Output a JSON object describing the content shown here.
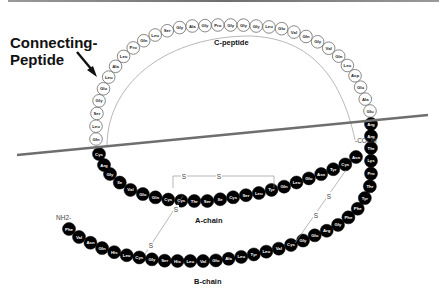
{
  "title": {
    "line1": "Connecting-",
    "line2": "Peptide"
  },
  "labels": {
    "c_peptide": "C-peptide",
    "a_chain": "A-chain",
    "b_chain": "B-chain",
    "nh2": "NH2-",
    "cooh": "-COOH",
    "sulfur": "S"
  },
  "colors": {
    "cleavage_line": "#6e6e6e",
    "chain_fill": "#000000",
    "c_peptide_fill": "#ffffff"
  },
  "c_peptide_residues": [
    "Gln",
    "Leu",
    "Ser",
    "Gly",
    "Glu",
    "Leu",
    "Ala",
    "Leu",
    "Pro",
    "Gln",
    "Leu",
    "Ser",
    "Gly",
    "Ala",
    "Gly",
    "Pro",
    "Gly",
    "Gly",
    "Gly",
    "Leu",
    "Glu",
    "Val",
    "Gln",
    "Gly",
    "Val",
    "Gln",
    "Leu",
    "Asp",
    "Glu",
    "Ala",
    "Glu"
  ],
  "dibasic_a_side": [
    "Cys",
    "Arg"
  ],
  "a_chain_residues": [
    "Gly",
    "Ile",
    "Val",
    "Glu",
    "Gln",
    "Cys",
    "Cys",
    "Thr",
    "Ser",
    "Ile",
    "Cys",
    "Ser",
    "Leu",
    "Tyr",
    "Gln",
    "Leu",
    "Glu",
    "Asn",
    "Tyr",
    "Cys",
    "Asn"
  ],
  "dibasic_b_side": [
    "Arg",
    "Arg"
  ],
  "b_chain_residues": [
    "Phe",
    "Val",
    "Asn",
    "Gln",
    "His",
    "Leu",
    "Cys",
    "Gly",
    "Ser",
    "His",
    "Leu",
    "Val",
    "Glu",
    "Ala",
    "Leu",
    "Tyr",
    "Leu",
    "Val",
    "Cys",
    "Gly",
    "Glu",
    "Arg",
    "Gly",
    "Phe",
    "Phe",
    "Tyr",
    "Thr",
    "Pro",
    "Lys",
    "Thr"
  ]
}
